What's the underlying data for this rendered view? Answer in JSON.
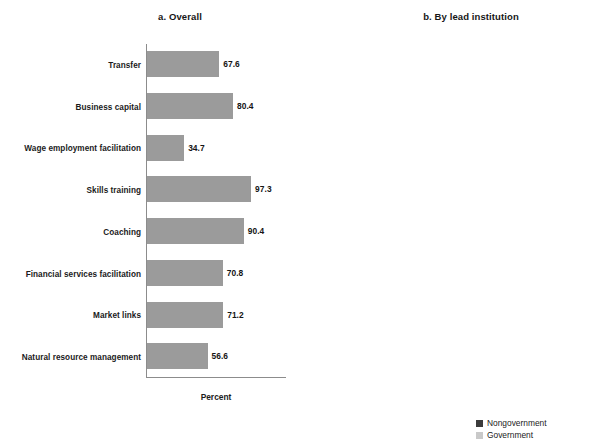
{
  "chart_data": [
    {
      "type": "bar",
      "id": "overall",
      "title": "a. Overall",
      "xlabel": "Percent",
      "ylabel": "",
      "xlim": [
        0,
        100
      ],
      "grid": false,
      "orientation": "horizontal",
      "categories": [
        "Transfer",
        "Business capital",
        "Wage employment facilitation",
        "Skills training",
        "Coaching",
        "Financial services facilitation",
        "Market links",
        "Natural resource management"
      ],
      "values": [
        67.6,
        80.4,
        34.7,
        97.3,
        90.4,
        70.8,
        71.2,
        56.6
      ],
      "value_labels": [
        "67.6",
        "80.4",
        "34.7",
        "97.3",
        "90.4",
        "70.8",
        "71.2",
        "56.6"
      ],
      "series_color": "#9b9b9b"
    },
    {
      "type": "bar",
      "id": "by-lead-institution",
      "title": "b. By lead institution",
      "xlabel": "Percent",
      "ylabel": "",
      "xlim": [
        0,
        100
      ],
      "grid": false,
      "orientation": "horizontal",
      "legend_position": "bottom-right",
      "categories": [
        "Transfer",
        "Business capital",
        "Wage employment facilitation",
        "Skills training",
        "Coaching",
        "Financial services facilitation",
        "Market links",
        "Natural resource management"
      ],
      "series": [
        {
          "name": "Nongovernment",
          "color": "#3b3b3b",
          "values": [
            65.2,
            84.8,
            27.7,
            99.1,
            93.8,
            76.8,
            72.3,
            57.1
          ],
          "value_labels": [
            "65.2",
            "84.8",
            "27.7",
            "99.1",
            "93.8",
            "76.8",
            "72.3",
            "57.1"
          ]
        },
        {
          "name": "Government",
          "color": "#c9c9c9",
          "values": [
            70.1,
            75.7,
            42.1,
            95.3,
            86.9,
            64.5,
            70.1,
            56.1
          ],
          "value_labels": [
            "70.1",
            "75.7",
            "42.1",
            "95.3",
            "86.9",
            "64.5",
            "70.1",
            "56.1"
          ]
        }
      ]
    }
  ],
  "legend": {
    "items": [
      {
        "label": "Nongovernment",
        "color": "#3b3b3b"
      },
      {
        "label": "Government",
        "color": "#c9c9c9"
      }
    ]
  }
}
